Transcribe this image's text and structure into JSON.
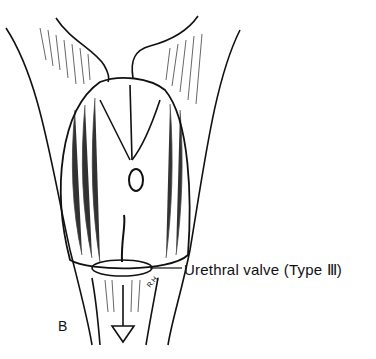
{
  "figure": {
    "panel_label": "B",
    "callout_label": "Urethral valve (Type Ⅲ)",
    "artist_initials": "R.H.",
    "colors": {
      "ink": "#111111",
      "background": "#ffffff"
    }
  }
}
